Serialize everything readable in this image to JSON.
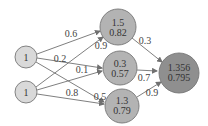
{
  "diagram": {
    "type": "neural-network",
    "colors": {
      "input_fill": "#d9d9d9",
      "hidden_fill": "#b3b3b3",
      "output_fill": "#8f8f8f",
      "stroke": "#777777"
    },
    "nodes": {
      "input1": {
        "label": "1"
      },
      "input2": {
        "label": "1"
      },
      "hidden1": {
        "net": "1.5",
        "out": "0.82"
      },
      "hidden2": {
        "net": "0.3",
        "out": "0.57"
      },
      "hidden3": {
        "net": "1.3",
        "out": "0.79"
      },
      "output": {
        "net": "1.356",
        "out": "0.795"
      }
    },
    "weights": {
      "i1_h1": "0.6",
      "i1_h2": "0.2",
      "i1_h3": "0.5",
      "i2_h1": "0.9",
      "i2_h2": "0.1",
      "i2_h3": "0.8",
      "h1_o": "0.3",
      "h2_o": "0.7",
      "h3_o": "0.9"
    }
  }
}
